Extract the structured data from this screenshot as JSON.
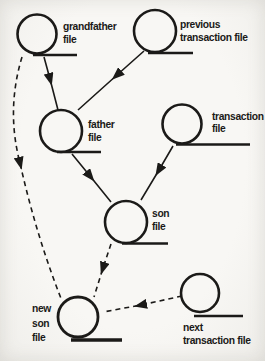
{
  "diagram_title": "grandfather-father-son file backup rotation",
  "colors": {
    "ink": "#1b1a18",
    "paper": "#f6f5f1"
  },
  "nodes": {
    "grandfather": {
      "label_lines": [
        "grandfather",
        "file"
      ]
    },
    "previous_transaction": {
      "label_lines": [
        "previous",
        "transaction file"
      ]
    },
    "father": {
      "label_lines": [
        "father",
        "file"
      ]
    },
    "transaction": {
      "label_lines": [
        "transaction",
        "file"
      ]
    },
    "son": {
      "label_lines": [
        "son",
        "file"
      ]
    },
    "new_son": {
      "label_lines": [
        "new",
        "son",
        "file"
      ]
    },
    "next_transaction": {
      "label_lines": [
        "next",
        "transaction file"
      ]
    }
  },
  "edges": [
    {
      "from": "grandfather file",
      "to": "father file",
      "style": "solid"
    },
    {
      "from": "previous transaction file",
      "to": "father file",
      "style": "solid"
    },
    {
      "from": "father file",
      "to": "son file",
      "style": "solid"
    },
    {
      "from": "transaction file",
      "to": "son file",
      "style": "solid"
    },
    {
      "from": "son file",
      "to": "new son file",
      "style": "dashed"
    },
    {
      "from": "grandfather file",
      "to": "new son file",
      "style": "dashed"
    },
    {
      "from": "next transaction file",
      "to": "new son file",
      "style": "dashed"
    }
  ]
}
